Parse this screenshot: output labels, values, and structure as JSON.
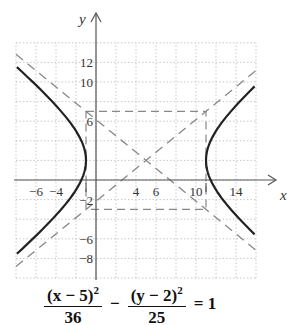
{
  "header": {
    "partial_text": "(11, 2); asymptotes y = ..."
  },
  "chart_data": {
    "type": "line",
    "title": "",
    "xlabel": "x",
    "ylabel": "y",
    "xlim": [
      -8,
      16
    ],
    "ylim": [
      -10,
      14
    ],
    "grid": true,
    "x_ticks": [
      -6,
      -4,
      4,
      6,
      10,
      14
    ],
    "x_tick_labels": [
      "−6",
      "−4",
      "4",
      "6",
      "10",
      "14"
    ],
    "y_ticks": [
      12,
      10,
      6,
      -2,
      -6,
      -8
    ],
    "y_tick_labels": [
      "12",
      "10",
      "6",
      "−2",
      "−6",
      "−8"
    ],
    "hyperbola": {
      "center": [
        5,
        2
      ],
      "a": 6,
      "b": 5,
      "orientation": "horizontal",
      "vertices": [
        [
          -1,
          2
        ],
        [
          11,
          2
        ]
      ]
    },
    "asymptotes": [
      {
        "slope": 0.8333,
        "through": [
          5,
          2
        ],
        "style": "dashed"
      },
      {
        "slope": -0.8333,
        "through": [
          5,
          2
        ],
        "style": "dashed"
      }
    ],
    "reference_box": {
      "x": [
        -1,
        11
      ],
      "y": [
        -3,
        7
      ],
      "style": "dashed"
    },
    "equation": {
      "term1_num": "(x − 5)",
      "term1_exp": "2",
      "term1_den": "36",
      "minus": "−",
      "term2_num": "(y − 2)",
      "term2_exp": "2",
      "term2_den": "25",
      "rhs": "= 1"
    }
  },
  "labels": {
    "x_axis": "x",
    "y_axis": "y"
  }
}
